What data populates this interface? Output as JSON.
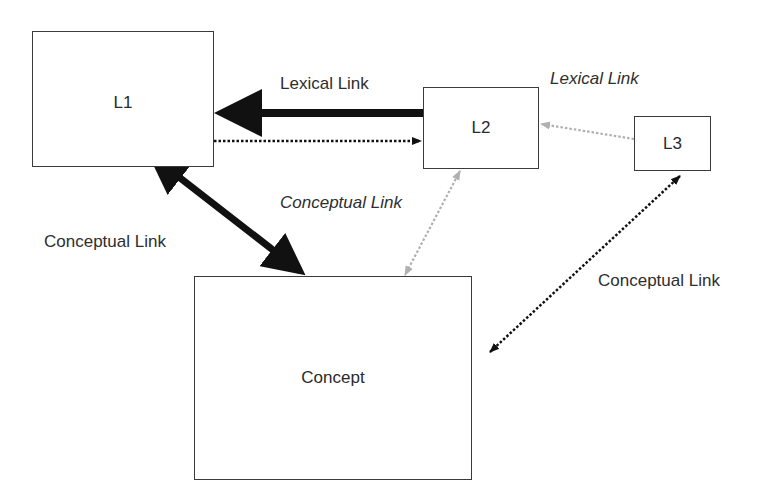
{
  "diagram": {
    "nodes": {
      "l1": {
        "label": "L1"
      },
      "l2": {
        "label": "L2"
      },
      "l3": {
        "label": "L3"
      },
      "concept": {
        "label": "Concept"
      }
    },
    "edges": {
      "l2_l1_lexical": {
        "label": "Lexical Link",
        "style": "thick-solid",
        "from": "L2",
        "to": "L1"
      },
      "l1_l2_lexical": {
        "label": "",
        "style": "dotted",
        "from": "L1",
        "to": "L2"
      },
      "l3_l2_lexical": {
        "label": "Lexical Link",
        "style": "gray-dotted-italic",
        "from": "L3",
        "to": "L2"
      },
      "l1_concept": {
        "label": "Conceptual Link",
        "style": "thick-solid-bidirectional",
        "from": "L1",
        "to": "Concept"
      },
      "l2_concept": {
        "label": "Conceptual Link",
        "style": "gray-dotted-bidirectional-italic",
        "from": "L2",
        "to": "Concept"
      },
      "l3_concept": {
        "label": "Conceptual Link",
        "style": "dotted-bidirectional",
        "from": "L3",
        "to": "Concept"
      }
    },
    "colors": {
      "dark": "#111111",
      "gray": "#b0b0b0",
      "border": "#3a3a3a"
    }
  }
}
